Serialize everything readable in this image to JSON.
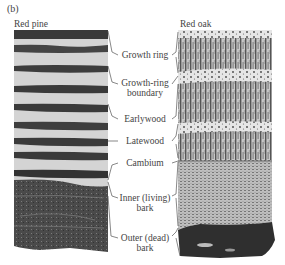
{
  "figure": {
    "panel_tag": "(b)",
    "left_panel": {
      "title": "Red pine"
    },
    "right_panel": {
      "title": "Red oak"
    },
    "labels": [
      {
        "id": "growth-ring",
        "lines": [
          "Growth ring"
        ]
      },
      {
        "id": "growth-ring-boundary",
        "lines": [
          "Growth-ring",
          "boundary"
        ]
      },
      {
        "id": "earlywood",
        "lines": [
          "Earlywood"
        ]
      },
      {
        "id": "latewood",
        "lines": [
          "Latewood"
        ]
      },
      {
        "id": "cambium",
        "lines": [
          "Cambium"
        ]
      },
      {
        "id": "inner-bark",
        "lines": [
          "Inner (living)",
          "bark"
        ]
      },
      {
        "id": "outer-bark",
        "lines": [
          "Outer (dead)",
          "bark"
        ]
      }
    ],
    "colors": {
      "ink": "#3a3a3a",
      "latewood_dark": "#2e2e2e",
      "earlywood_light": "#d8d8d8",
      "bark_dark": "#333333",
      "oak_inner_bark": "#9a9a9a"
    }
  }
}
